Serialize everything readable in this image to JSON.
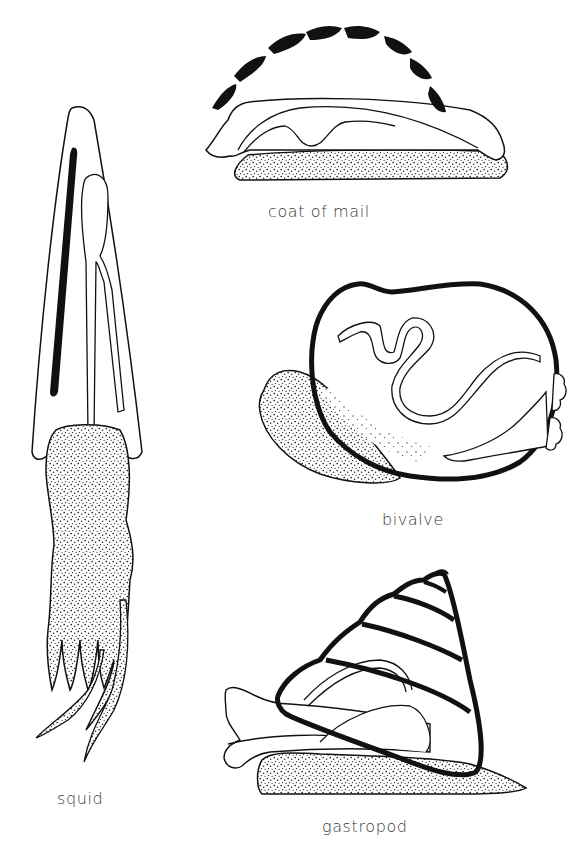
{
  "diagram": {
    "type": "scientific-illustration",
    "colors": {
      "ink": "#111111",
      "stipple": "#333333",
      "label": "#3a3a3a",
      "background": "#ffffff"
    },
    "figures": [
      {
        "id": "coat-of-mail",
        "label": "coat of mail"
      },
      {
        "id": "bivalve",
        "label": "bivalve"
      },
      {
        "id": "squid",
        "label": "squid"
      },
      {
        "id": "gastropod",
        "label": "gastropod"
      }
    ]
  }
}
